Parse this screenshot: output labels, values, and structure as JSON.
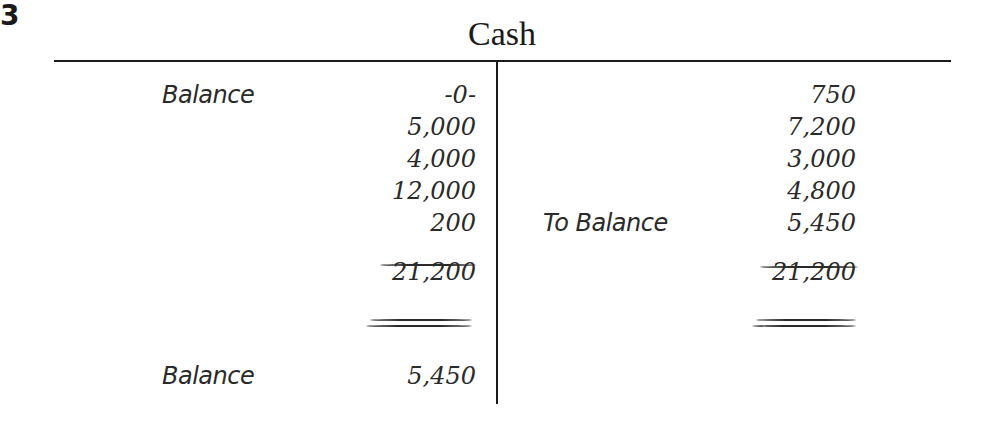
{
  "figure_number": "3",
  "account": {
    "title": "Cash",
    "debit_side": {
      "entries": [
        {
          "label": "Balance",
          "amount": "-0-"
        },
        {
          "label": "",
          "amount": "5,000"
        },
        {
          "label": "",
          "amount": "4,000"
        },
        {
          "label": "",
          "amount": "12,000"
        },
        {
          "label": "",
          "amount": "200"
        }
      ],
      "total": "21,200",
      "closing": {
        "label": "Balance",
        "amount": "5,450"
      }
    },
    "credit_side": {
      "entries": [
        {
          "label": "",
          "amount": "750"
        },
        {
          "label": "",
          "amount": "7,200"
        },
        {
          "label": "",
          "amount": "3,000"
        },
        {
          "label": "",
          "amount": "4,800"
        },
        {
          "label": "To Balance",
          "amount": "5,450"
        }
      ],
      "total": "21,200"
    }
  }
}
